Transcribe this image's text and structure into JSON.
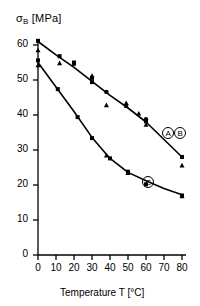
{
  "chart_data": {
    "type": "scatter",
    "title": "",
    "xlabel": "Temperature T [°C]",
    "ylabel": "σB [MPa]",
    "ylabel_main": "σ",
    "ylabel_sub": "B",
    "ylabel_unit": "[MPa]",
    "xlim": [
      0,
      80
    ],
    "ylim": [
      0,
      65
    ],
    "xticks": [
      0,
      10,
      20,
      30,
      40,
      50,
      60,
      70,
      80
    ],
    "yticks": [
      0,
      10,
      20,
      30,
      40,
      50,
      60
    ],
    "xtick_labels": [
      "0",
      "10",
      "20",
      "30",
      "40",
      "50",
      "60",
      "70",
      "80"
    ],
    "ytick_labels": [
      "0",
      "10",
      "20",
      "30",
      "40",
      "50",
      "60"
    ],
    "grid": false,
    "legend_position": "inline-right",
    "line_color": "#000000",
    "marker_color": "#000000",
    "series": [
      {
        "name": "A/B",
        "label": "ⒶⒷ",
        "label_parts": [
          "A",
          "B"
        ],
        "label_x": 69,
        "label_y": 35,
        "curve": [
          {
            "x": 0,
            "y": 61.0
          },
          {
            "x": 10,
            "y": 57.2
          },
          {
            "x": 20,
            "y": 53.6
          },
          {
            "x": 30,
            "y": 49.6
          },
          {
            "x": 40,
            "y": 45.6
          },
          {
            "x": 50,
            "y": 42.0
          },
          {
            "x": 60,
            "y": 38.0
          },
          {
            "x": 70,
            "y": 33.0
          },
          {
            "x": 80,
            "y": 28.0
          }
        ],
        "points_square": [
          {
            "x": 0,
            "y": 61.2
          },
          {
            "x": 12,
            "y": 56.8
          },
          {
            "x": 20,
            "y": 55.0
          },
          {
            "x": 30,
            "y": 50.6
          },
          {
            "x": 30,
            "y": 49.4
          },
          {
            "x": 49,
            "y": 42.6
          },
          {
            "x": 60,
            "y": 38.2
          },
          {
            "x": 80,
            "y": 28.0
          }
        ],
        "points_triangle": [
          {
            "x": 0,
            "y": 58.5
          },
          {
            "x": 12,
            "y": 54.8
          },
          {
            "x": 30,
            "y": 51.2
          },
          {
            "x": 38,
            "y": 42.8
          },
          {
            "x": 49,
            "y": 43.4
          },
          {
            "x": 56,
            "y": 40.4
          },
          {
            "x": 60,
            "y": 37.2
          },
          {
            "x": 80,
            "y": 25.6
          }
        ],
        "points_circle": [
          {
            "x": 20,
            "y": 54.6
          },
          {
            "x": 38,
            "y": 46.6
          },
          {
            "x": 60,
            "y": 38.8
          }
        ]
      },
      {
        "name": "C",
        "label": "Ⓒ",
        "label_parts": [
          "C"
        ],
        "label_x": 58,
        "label_y": 21.0,
        "curve": [
          {
            "x": 0,
            "y": 55.0
          },
          {
            "x": 10,
            "y": 48.0
          },
          {
            "x": 20,
            "y": 41.0
          },
          {
            "x": 30,
            "y": 33.6
          },
          {
            "x": 40,
            "y": 27.6
          },
          {
            "x": 50,
            "y": 23.6
          },
          {
            "x": 60,
            "y": 21.2
          },
          {
            "x": 70,
            "y": 19.0
          },
          {
            "x": 80,
            "y": 17.2
          }
        ],
        "points_square": [
          {
            "x": 0,
            "y": 55.6
          },
          {
            "x": 11,
            "y": 47.4
          },
          {
            "x": 22,
            "y": 39.4
          },
          {
            "x": 30,
            "y": 33.4
          },
          {
            "x": 40,
            "y": 27.6
          },
          {
            "x": 50,
            "y": 23.8
          },
          {
            "x": 60,
            "y": 20.2
          },
          {
            "x": 80,
            "y": 17.0
          }
        ],
        "points_triangle": [
          {
            "x": 0,
            "y": 54.2
          },
          {
            "x": 38,
            "y": 28.4
          },
          {
            "x": 50,
            "y": 23.4
          },
          {
            "x": 80,
            "y": 16.8
          }
        ],
        "points_circle": []
      }
    ]
  }
}
